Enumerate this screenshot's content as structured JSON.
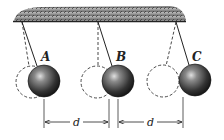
{
  "diagram": {
    "type": "pendulum-array",
    "ceiling": {
      "x1": 14,
      "x2": 186,
      "y": 21,
      "color": "#6a6a6a"
    },
    "pendulums": [
      {
        "label": "A",
        "pivot": [
          22,
          22
        ],
        "ball": {
          "cx": 44,
          "cy": 81,
          "r": 16
        },
        "rest": {
          "cx": 32,
          "cy": 82,
          "r": 16
        },
        "label_pos": [
          46,
          61
        ]
      },
      {
        "label": "B",
        "pivot": [
          98,
          22
        ],
        "ball": {
          "cx": 118,
          "cy": 81,
          "r": 16
        },
        "rest": {
          "cx": 97,
          "cy": 82,
          "r": 16
        },
        "label_pos": [
          120,
          61
        ]
      },
      {
        "label": "C",
        "pivot": [
          176,
          22
        ],
        "ball": {
          "cx": 195,
          "cy": 80,
          "r": 16
        },
        "rest": {
          "cx": 163,
          "cy": 81,
          "r": 16
        },
        "label_pos": [
          195,
          61
        ]
      }
    ],
    "dimensions": [
      {
        "label": "d",
        "x1": 44,
        "x2": 109,
        "y": 122
      },
      {
        "label": "d",
        "x1": 118,
        "x2": 183,
        "y": 122
      }
    ],
    "colors": {
      "ball_dark": "#1e1e1e",
      "ball_light": "#d8d8d8",
      "line": "#2a2a2a"
    }
  }
}
